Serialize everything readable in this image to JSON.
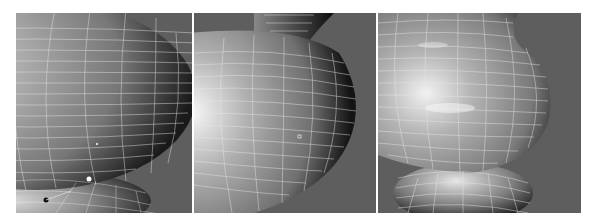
{
  "figure": {
    "background_color": "#5e5e5e",
    "wire_color": "#e8e8e8",
    "panels": [
      {
        "id": "panel-1",
        "label": "",
        "stage": "bulb with selected vertex ring"
      },
      {
        "id": "panel-2",
        "label": "",
        "stage": "bulb body with upper neck"
      },
      {
        "id": "panel-3",
        "label": "",
        "stage": "full vase shape with base"
      }
    ]
  }
}
